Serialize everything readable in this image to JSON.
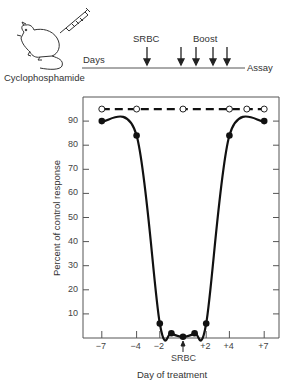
{
  "schedule": {
    "drug_label": "Cyclophosphamide",
    "timeline_start_label": "Days",
    "timeline_end_label": "Assay",
    "antigen_label": "SRBC",
    "boost_label": "Boost",
    "boost_arrow_count": 4
  },
  "chart_data": {
    "type": "line",
    "title": "",
    "xlabel": "Day of treatment",
    "ylabel": "Percent of control response",
    "x_tick_labels": [
      "-7",
      "-4",
      "-2",
      "SRBC",
      "+2",
      "+4",
      "+7"
    ],
    "x_tick_values": [
      -7,
      -4,
      -2,
      0,
      2,
      4,
      7
    ],
    "y_tick_labels": [
      "10",
      "20",
      "30",
      "40",
      "50",
      "60",
      "70",
      "80",
      "90"
    ],
    "ylim": [
      0,
      100
    ],
    "xlim": [
      -8,
      9
    ],
    "grid": false,
    "annotations": [
      {
        "text": "SRBC",
        "x": 0,
        "arrow": "up"
      }
    ],
    "series": [
      {
        "name": "Cyclophosphamide-treated",
        "style": "solid",
        "marker": "filled-circle",
        "x": [
          -7,
          -4,
          -2,
          -1,
          0,
          1,
          2,
          4,
          7
        ],
        "values": [
          90,
          84,
          6,
          2,
          0.5,
          2,
          6,
          84,
          90
        ]
      },
      {
        "name": "Control",
        "style": "dashed",
        "marker": "open-circle",
        "x": [
          -7,
          -4,
          0,
          4,
          5.5,
          7
        ],
        "values": [
          95,
          95,
          95,
          95,
          95,
          95
        ]
      }
    ]
  }
}
